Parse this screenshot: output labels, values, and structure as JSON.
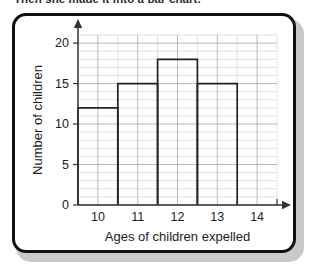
{
  "caption": {
    "text": "Then she made it into a bar chart."
  },
  "colors": {
    "frame": "#111111",
    "shadow": "#c9c9c9",
    "background": "#ffffff",
    "axis": "#333333",
    "grid_minor": "#c3ccd6",
    "grid_major": "#9aa6b3",
    "bar_outline": "#222222",
    "text": "#1c1c1c"
  },
  "chart_data": {
    "type": "bar",
    "title": "",
    "xlabel": "Ages of children expelled",
    "ylabel": "Number of children",
    "categories": [
      "10",
      "11",
      "12",
      "13",
      "14"
    ],
    "values": [
      12,
      15,
      18,
      15,
      0
    ],
    "x_tick_labels": [
      "10",
      "11",
      "12",
      "13",
      "14"
    ],
    "y_tick_labels": [
      "0",
      "5",
      "10",
      "15",
      "20"
    ],
    "y_ticks": [
      0,
      5,
      10,
      15,
      20
    ],
    "ylim": [
      0,
      21
    ],
    "xlim": [
      9.5,
      14.5
    ],
    "y_minor_step": 1,
    "x_minor_step": 0.5,
    "bar_width": 1,
    "bar_style": "outline",
    "grid": true,
    "legend": null
  }
}
